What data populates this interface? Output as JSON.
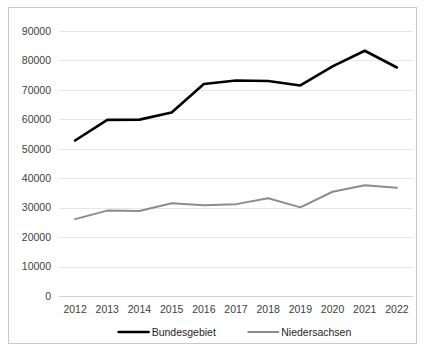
{
  "chart_data": {
    "type": "line",
    "title": "",
    "subtitle": "",
    "xlabel": "",
    "ylabel": "",
    "categories": [
      "2012",
      "2013",
      "2014",
      "2015",
      "2016",
      "2017",
      "2018",
      "2019",
      "2020",
      "2021",
      "2022"
    ],
    "x": [
      2012,
      2013,
      2014,
      2015,
      2016,
      2017,
      2018,
      2019,
      2020,
      2021,
      2022
    ],
    "series": [
      {
        "name": "Bundesgebiet",
        "color": "#000000",
        "values": [
          52800,
          59800,
          59900,
          62300,
          72000,
          73200,
          73000,
          71500,
          78000,
          83300,
          77600
        ]
      },
      {
        "name": "Niedersachsen",
        "color": "#8c8c8c",
        "values": [
          26100,
          29000,
          28900,
          31500,
          30800,
          31200,
          33200,
          30100,
          35400,
          37600,
          36800
        ]
      }
    ],
    "ylim": [
      0,
      90000
    ],
    "ytick_values": [
      0,
      10000,
      20000,
      30000,
      40000,
      50000,
      60000,
      70000,
      80000,
      90000
    ],
    "ytick_labels": [
      "0",
      "10000",
      "20000",
      "30000",
      "40000",
      "50000",
      "60000",
      "70000",
      "80000",
      "90000"
    ],
    "grid": true,
    "grid_axis": "y",
    "legend_position": "bottom",
    "legend_entries": [
      "Bundesgebiet",
      "Niedersachsen"
    ],
    "annotations": []
  },
  "colors": {
    "series_primary": "#000000",
    "series_secondary": "#8c8c8c",
    "gridline": "#e8e8e8",
    "frame_border": "#c9c9c9",
    "tick_text": "#404040",
    "background": "#ffffff"
  }
}
